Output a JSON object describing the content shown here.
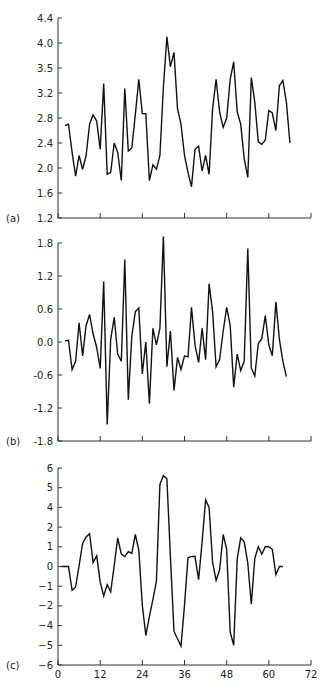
{
  "chart_data": [
    {
      "type": "line",
      "panel_label": "(a)",
      "title": "",
      "xlabel": "",
      "ylabel": "",
      "xlim": [
        0,
        72
      ],
      "x_ticks": [
        0,
        12,
        24,
        36,
        48,
        60,
        72
      ],
      "x_tick_labels_shown": false,
      "ylim": [
        1.2,
        4.4
      ],
      "y_tick_labels": [
        "4.4",
        "4.0",
        "3.5",
        "3.2",
        "2.8",
        "2.4",
        "2.0",
        "1.6",
        "1.2"
      ],
      "grid": false,
      "x_start": 2,
      "values": [
        2.68,
        2.7,
        2.25,
        1.87,
        2.2,
        1.98,
        2.2,
        2.7,
        2.85,
        2.75,
        2.3,
        3.35,
        1.9,
        1.93,
        2.4,
        2.25,
        1.8,
        3.27,
        2.27,
        2.32,
        2.85,
        3.42,
        2.87,
        2.87,
        1.8,
        2.05,
        1.98,
        2.2,
        3.3,
        4.1,
        3.62,
        3.85,
        2.95,
        2.7,
        2.2,
        1.93,
        1.7,
        2.3,
        2.35,
        1.95,
        2.2,
        1.9,
        2.95,
        3.42,
        2.9,
        2.65,
        2.8,
        3.42,
        3.7,
        2.9,
        2.7,
        2.15,
        1.85,
        3.45,
        3.05,
        2.42,
        2.38,
        2.45,
        2.92,
        2.88,
        2.6,
        3.32,
        3.4,
        3.05,
        2.4
      ]
    },
    {
      "type": "line",
      "panel_label": "(b)",
      "title": "",
      "xlabel": "",
      "ylabel": "",
      "xlim": [
        0,
        72
      ],
      "x_ticks": [
        0,
        12,
        24,
        36,
        48,
        60,
        72
      ],
      "x_tick_labels_shown": false,
      "ylim": [
        -1.8,
        1.8
      ],
      "y_tick_labels": [
        "1.8",
        "1.2",
        "0.6",
        "0.0",
        "-0.6",
        "-1.2",
        "-1.8"
      ],
      "grid": false,
      "x_start": 2,
      "values": [
        0.02,
        0.03,
        -0.5,
        -0.35,
        0.35,
        -0.25,
        0.3,
        0.5,
        0.15,
        -0.1,
        -0.48,
        1.1,
        -1.5,
        0.05,
        0.45,
        -0.22,
        -0.35,
        1.5,
        -1.05,
        0.1,
        0.55,
        0.62,
        -0.58,
        0.0,
        -1.12,
        0.25,
        -0.05,
        0.25,
        1.92,
        -0.45,
        0.2,
        -0.88,
        -0.28,
        -0.5,
        -0.25,
        -0.27,
        0.63,
        -0.05,
        -0.37,
        0.25,
        -0.32,
        1.06,
        0.55,
        -0.45,
        -0.32,
        0.2,
        0.63,
        0.3,
        -0.82,
        -0.22,
        -0.52,
        -0.35,
        1.7,
        -0.47,
        -0.62,
        -0.03,
        0.06,
        0.48,
        -0.05,
        -0.25,
        0.73,
        0.05,
        -0.35,
        -0.63
      ]
    },
    {
      "type": "line",
      "panel_label": "(c)",
      "title": "",
      "xlabel": "",
      "ylabel": "",
      "xlim": [
        0,
        72
      ],
      "x_ticks": [
        0,
        12,
        24,
        36,
        48,
        60,
        72
      ],
      "x_tick_labels": [
        "0",
        "12",
        "24",
        "36",
        "48",
        "60",
        "72"
      ],
      "ylim": [
        -6,
        6
      ],
      "y_tick_labels": [
        "6",
        "5",
        "4",
        "2",
        "1",
        "0",
        "−1",
        "−2",
        "−4",
        "−5",
        "−6"
      ],
      "y_tick_note": "tick labels are equally spaced as printed (3 and -3 omitted)",
      "grid": false,
      "x_start": 1,
      "values": [
        0.0,
        0.0,
        0.0,
        -1.45,
        -1.25,
        0.05,
        1.4,
        1.8,
        2.0,
        0.25,
        0.65,
        -0.95,
        -1.8,
        -1.1,
        -1.55,
        0.05,
        1.75,
        0.75,
        0.6,
        0.9,
        0.8,
        1.95,
        1.0,
        -2.35,
        -4.2,
        -3.05,
        -2.0,
        -0.9,
        5.0,
        5.55,
        5.35,
        0.6,
        -3.95,
        -4.4,
        -4.85,
        -2.35,
        0.55,
        0.6,
        0.62,
        -0.8,
        1.5,
        4.05,
        3.6,
        0.25,
        -0.85,
        -0.2,
        1.95,
        1.05,
        -4.0,
        -4.8,
        0.45,
        1.75,
        1.5,
        0.2,
        -2.3,
        0.5,
        1.2,
        0.75,
        1.2,
        1.2,
        1.05,
        -0.5,
        0.0,
        0.0
      ]
    }
  ],
  "panels": {
    "a": {
      "label": "(a)"
    },
    "b": {
      "label": "(b)"
    },
    "c": {
      "label": "(c)"
    }
  },
  "style": {
    "line_color": "#111111",
    "axis_color": "#333333"
  }
}
